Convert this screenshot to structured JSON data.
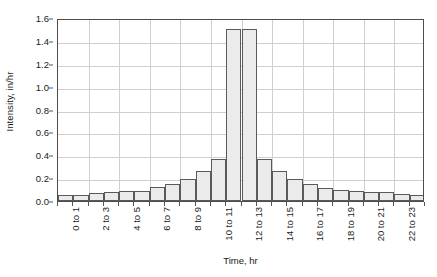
{
  "chart_data": {
    "type": "bar",
    "title": "",
    "xlabel": "Time, hr",
    "ylabel": "Intensity, in/hr",
    "categories": [
      "0 to 1",
      "1 to 2",
      "2 to 3",
      "3 to 4",
      "4 to 5",
      "5 to 6",
      "6 to 7",
      "7 to 8",
      "8 to 9",
      "9 to 10",
      "10 to 11",
      "11 to 12",
      "12 to 13",
      "13 to 14",
      "14 to 15",
      "15 to 16",
      "16 to 17",
      "17 to 18",
      "18 to 19",
      "19 to 20",
      "20 to 21",
      "21 to 22",
      "22 to 23",
      "23 to 24"
    ],
    "values": [
      0.05,
      0.05,
      0.07,
      0.08,
      0.085,
      0.09,
      0.12,
      0.145,
      0.195,
      0.26,
      0.37,
      1.5,
      1.5,
      0.37,
      0.26,
      0.195,
      0.145,
      0.115,
      0.095,
      0.085,
      0.08,
      0.075,
      0.06,
      0.055
    ],
    "ylim": [
      0.0,
      1.6
    ],
    "ytick_values": [
      0.0,
      0.2,
      0.4,
      0.6,
      0.8,
      1.0,
      1.2,
      1.4,
      1.6
    ],
    "ytick_labels": [
      "0.0",
      "0.2",
      "0.4",
      "0.6",
      "0.8",
      "1.0",
      "1.2",
      "1.4",
      "1.6"
    ],
    "xtick_labels": [
      "0 to 1",
      "2 to 3",
      "4 to 5",
      "6 to 7",
      "8 to 9",
      "10 to 11",
      "12 to 13",
      "14 to 15",
      "16 to 17",
      "18 to 19",
      "20 to 21",
      "22 to 23"
    ],
    "xtick_indices": [
      0,
      2,
      4,
      6,
      8,
      10,
      12,
      14,
      16,
      18,
      20,
      22
    ],
    "grid": true,
    "legend": false,
    "bar_fill_color": "#ebebeb",
    "bar_border_color": "#5a5a5a",
    "grid_color": "#cfcfcf",
    "axis_color": "#4d4d4d",
    "background_color": "#ffffff"
  }
}
